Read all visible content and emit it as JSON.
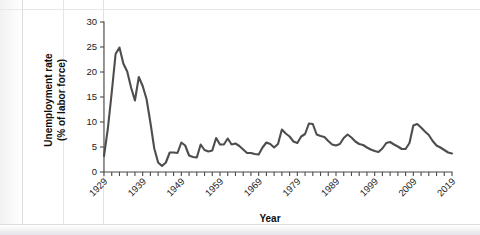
{
  "chart_data": {
    "type": "line",
    "title": "",
    "xlabel": "Year",
    "ylabel": "Unemployment rate (% of labor force)",
    "ylabel_line1": "Unemployment rate",
    "ylabel_line2": "(% of labor force)",
    "xlim": [
      1929,
      2019
    ],
    "ylim": [
      0,
      30
    ],
    "yticks": [
      0,
      5,
      10,
      15,
      20,
      25,
      30
    ],
    "ytick_labels": [
      "0",
      "5",
      "10",
      "15",
      "20",
      "25",
      "30"
    ],
    "xticks": [
      1929,
      1939,
      1949,
      1959,
      1969,
      1979,
      1989,
      1999,
      2009,
      2019
    ],
    "xtick_labels": [
      "1929",
      "1939",
      "1949",
      "1959",
      "1969",
      "1979",
      "1989",
      "1999",
      "2009",
      "2019"
    ],
    "xtick_minor_step": 2,
    "grid": false,
    "legend": false,
    "line_color": "#4d4d4d",
    "background_color": "#ffffff",
    "x": [
      1929,
      1930,
      1931,
      1932,
      1933,
      1934,
      1935,
      1936,
      1937,
      1938,
      1939,
      1940,
      1941,
      1942,
      1943,
      1944,
      1945,
      1946,
      1947,
      1948,
      1949,
      1950,
      1951,
      1952,
      1953,
      1954,
      1955,
      1956,
      1957,
      1958,
      1959,
      1960,
      1961,
      1962,
      1963,
      1964,
      1965,
      1966,
      1967,
      1968,
      1969,
      1970,
      1971,
      1972,
      1973,
      1974,
      1975,
      1976,
      1977,
      1978,
      1979,
      1980,
      1981,
      1982,
      1983,
      1984,
      1985,
      1986,
      1987,
      1988,
      1989,
      1990,
      1991,
      1992,
      1993,
      1994,
      1995,
      1996,
      1997,
      1998,
      1999,
      2000,
      2001,
      2002,
      2003,
      2004,
      2005,
      2006,
      2007,
      2008,
      2009,
      2010,
      2011,
      2012,
      2013,
      2014,
      2015,
      2016,
      2017,
      2018,
      2019
    ],
    "values": [
      3.2,
      8.7,
      15.9,
      23.6,
      24.9,
      21.7,
      20.1,
      16.9,
      14.3,
      19.0,
      17.2,
      14.6,
      9.9,
      4.7,
      1.9,
      1.2,
      1.9,
      3.9,
      3.9,
      3.8,
      5.9,
      5.3,
      3.3,
      3.0,
      2.9,
      5.5,
      4.4,
      4.1,
      4.3,
      6.8,
      5.5,
      5.5,
      6.7,
      5.5,
      5.7,
      5.2,
      4.5,
      3.8,
      3.8,
      3.6,
      3.5,
      4.9,
      5.9,
      5.6,
      4.9,
      5.6,
      8.5,
      7.7,
      7.1,
      6.1,
      5.8,
      7.1,
      7.6,
      9.7,
      9.6,
      7.5,
      7.2,
      7.0,
      6.2,
      5.5,
      5.3,
      5.6,
      6.8,
      7.5,
      6.9,
      6.1,
      5.6,
      5.4,
      4.9,
      4.5,
      4.2,
      4.0,
      4.7,
      5.8,
      6.0,
      5.5,
      5.1,
      4.6,
      4.6,
      5.8,
      9.3,
      9.6,
      8.9,
      8.1,
      7.4,
      6.2,
      5.3,
      4.9,
      4.4,
      3.9,
      3.7
    ]
  },
  "artifacts": {
    "ghost_note": ""
  }
}
